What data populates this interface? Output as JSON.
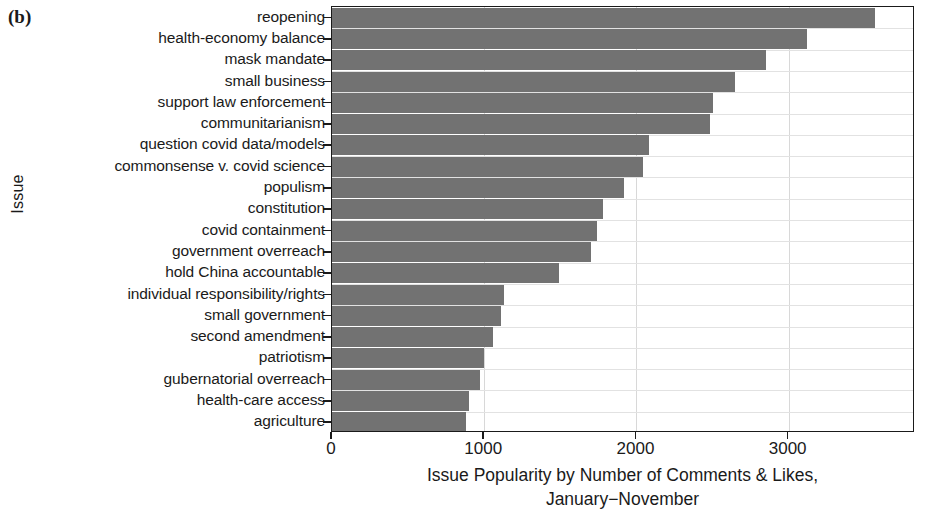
{
  "panel": {
    "label": "(b)"
  },
  "axes": {
    "y_title": "Issue",
    "x_title_line1": "Issue Popularity by Number of Comments & Likes,",
    "x_title_line2": "January−November",
    "x_ticks": [
      "0",
      "1000",
      "2000",
      "3000"
    ]
  },
  "chart_data": {
    "type": "bar",
    "orientation": "horizontal",
    "title": "",
    "xlabel": "Issue Popularity by Number of Comments & Likes, January−November",
    "ylabel": "Issue",
    "xlim": [
      0,
      3830
    ],
    "grid": true,
    "legend": "none",
    "bar_color": "#727272",
    "categories": [
      "reopening",
      "health-economy balance",
      "mask mandate",
      "small business",
      "support law enforcement",
      "communitarianism",
      "question covid data/models",
      "commonsense v. covid science",
      "populism",
      "constitution",
      "covid containment",
      "government overreach",
      "hold China accountable",
      "individual responsibility/rights",
      "small government",
      "second amendment",
      "patriotism",
      "gubernatorial overreach",
      "health-care access",
      "agriculture"
    ],
    "values": [
      3570,
      3120,
      2850,
      2650,
      2500,
      2480,
      2080,
      2040,
      1920,
      1780,
      1740,
      1700,
      1490,
      1130,
      1110,
      1060,
      1000,
      970,
      900,
      880
    ]
  }
}
